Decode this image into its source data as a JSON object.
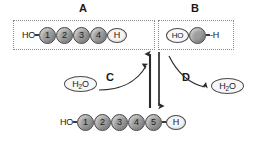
{
  "diagram": {
    "title_text": "",
    "panels": [
      {
        "label": "A",
        "kind": "polymer-chain",
        "left_end_text": "HO",
        "right_end_text": "H",
        "monomers": [
          "1",
          "2",
          "3",
          "4"
        ]
      },
      {
        "label": "B",
        "kind": "monomer-unit",
        "left_end_text": "HO",
        "right_end_text": "-H",
        "monomers": [
          ""
        ]
      }
    ],
    "bottom_chain": {
      "left_end_text": "HO",
      "right_end_text": "H",
      "monomers": [
        "1",
        "2",
        "3",
        "4",
        "5"
      ]
    },
    "reactions": [
      {
        "label": "C",
        "molecule": "H2O",
        "molecule_display": "H₂O",
        "direction": "upward",
        "role": "reactant"
      },
      {
        "label": "D",
        "molecule": "H2O",
        "molecule_display": "H₂O",
        "direction": "downward",
        "role": "product"
      }
    ],
    "arrows": [
      {
        "name": "up-arrow",
        "direction": "up"
      },
      {
        "name": "down-arrow",
        "direction": "down"
      }
    ],
    "colors": {
      "monomer_fill": "#9d9d9d",
      "monomer_stroke": "#4a4a4a",
      "cap_fill": "#f4f4f4",
      "box_border": "#8a8a8a",
      "arrow": "#2b2b2b",
      "text": "#1a1a1a",
      "background": "#ffffff"
    }
  }
}
